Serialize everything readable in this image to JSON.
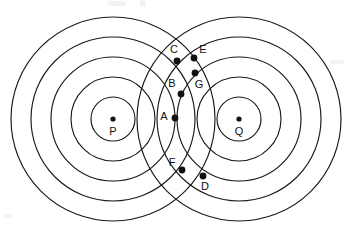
{
  "figure": {
    "canvas": {
      "width": 356,
      "height": 238
    },
    "background_color": "#ffffff",
    "stroke_color": "#1a1a1a",
    "dot_color": "#111111",
    "stroke_width": 1.15
  },
  "sources": [
    {
      "id": "P",
      "label": "P",
      "cx": 113,
      "cy": 119,
      "dot_radius": 2.6,
      "label_x": 113,
      "label_y": 132,
      "ring_radii": [
        22,
        42,
        62,
        82,
        102
      ]
    },
    {
      "id": "Q",
      "label": "Q",
      "cx": 239,
      "cy": 119,
      "dot_radius": 2.6,
      "label_x": 239,
      "label_y": 132,
      "ring_radii": [
        22,
        42,
        62,
        82,
        102
      ]
    }
  ],
  "points": [
    {
      "id": "A",
      "label": "A",
      "x": 175,
      "y": 118,
      "dot_radius": 3.4,
      "label_x": 164,
      "label_y": 117
    },
    {
      "id": "B",
      "label": "B",
      "x": 181,
      "y": 94,
      "dot_radius": 3.4,
      "label_x": 172,
      "label_y": 84
    },
    {
      "id": "C",
      "label": "C",
      "x": 177,
      "y": 61,
      "dot_radius": 3.4,
      "label_x": 174,
      "label_y": 50
    },
    {
      "id": "D",
      "label": "D",
      "x": 203,
      "y": 176,
      "dot_radius": 3.4,
      "label_x": 205,
      "label_y": 187
    },
    {
      "id": "E",
      "label": "E",
      "x": 194,
      "y": 58,
      "dot_radius": 3.4,
      "label_x": 203,
      "label_y": 50
    },
    {
      "id": "F",
      "label": "F",
      "x": 182,
      "y": 170,
      "dot_radius": 3.4,
      "label_x": 172,
      "label_y": 163
    },
    {
      "id": "G",
      "label": "G",
      "x": 195,
      "y": 73,
      "dot_radius": 3.4,
      "label_x": 199,
      "label_y": 85
    }
  ]
}
